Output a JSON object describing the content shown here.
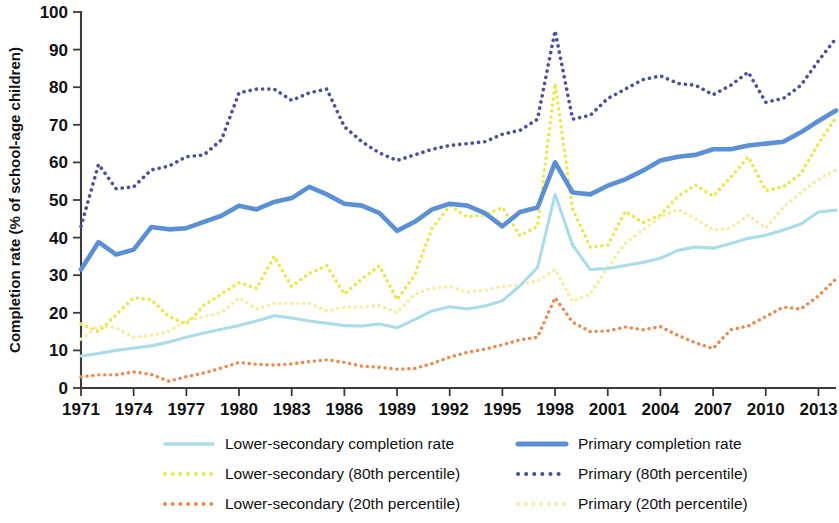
{
  "chart_data": {
    "type": "line",
    "title": "",
    "xlabel": "",
    "ylabel": "Completion rate (% of school-age children)",
    "xlim": [
      1971,
      2014
    ],
    "ylim": [
      0,
      100
    ],
    "grid": false,
    "legend_position": "bottom",
    "y_ticks": [
      0,
      10,
      20,
      30,
      40,
      50,
      60,
      70,
      80,
      90,
      100
    ],
    "y_tick_labels": [
      "0",
      "10",
      "20",
      "30",
      "40",
      "50",
      "60",
      "70",
      "80",
      "90",
      "100"
    ],
    "x_ticks": [
      1971,
      1974,
      1977,
      1980,
      1983,
      1986,
      1989,
      1992,
      1995,
      1998,
      2001,
      2004,
      2007,
      2010,
      2013
    ],
    "x_tick_labels": [
      "1971",
      "1974",
      "1977",
      "1980",
      "1983",
      "1986",
      "1989",
      "1992",
      "1995",
      "1998",
      "2001",
      "2004",
      "2007",
      "2010",
      "2013"
    ],
    "x": [
      1971,
      1972,
      1973,
      1974,
      1975,
      1976,
      1977,
      1978,
      1979,
      1980,
      1981,
      1982,
      1983,
      1984,
      1985,
      1986,
      1987,
      1988,
      1989,
      1990,
      1991,
      1992,
      1993,
      1994,
      1995,
      1996,
      1997,
      1998,
      1999,
      2000,
      2001,
      2002,
      2003,
      2004,
      2005,
      2006,
      2007,
      2008,
      2009,
      2010,
      2011,
      2012,
      2013,
      2014
    ],
    "series": [
      {
        "name": "Lower-secondary completion rate",
        "key": "ls_rate",
        "color": "#aadcea",
        "style": "solid",
        "width": 3.1,
        "values": [
          8.5,
          9.2,
          10.0,
          10.6,
          11.2,
          12.2,
          13.5,
          14.6,
          15.6,
          16.6,
          17.8,
          19.2,
          18.6,
          17.8,
          17.2,
          16.6,
          16.5,
          17.0,
          16.0,
          18.2,
          20.5,
          21.6,
          21.0,
          21.8,
          23.2,
          27.2,
          32.0,
          51.5,
          38.0,
          31.5,
          31.8,
          32.6,
          33.4,
          34.5,
          36.6,
          37.5,
          37.2,
          38.4,
          39.8,
          40.6,
          42.0,
          43.6,
          46.8,
          47.3
        ]
      },
      {
        "name": "Lower-secondary (80th percentile)",
        "key": "ls_p80",
        "color": "#e8e84a",
        "style": "dotted",
        "width": 3.4,
        "values": [
          17.0,
          15.0,
          19.5,
          24.0,
          23.5,
          19.0,
          17.0,
          22.0,
          25.0,
          28.0,
          26.5,
          35.0,
          27.0,
          30.5,
          32.5,
          25.0,
          29.0,
          32.5,
          23.5,
          30.0,
          42.5,
          48.5,
          45.5,
          46.0,
          48.0,
          40.5,
          43.0,
          81.0,
          47.5,
          37.5,
          38.0,
          47.0,
          44.0,
          46.0,
          51.0,
          54.0,
          51.0,
          56.0,
          61.5,
          52.5,
          53.5,
          57.0,
          65.0,
          72.0
        ]
      },
      {
        "name": "Lower-secondary (20th percentile)",
        "key": "ls_p20",
        "color": "#ec8a4d",
        "style": "dotted",
        "width": 3.4,
        "values": [
          3.0,
          3.5,
          3.5,
          4.3,
          3.6,
          1.8,
          3.0,
          4.0,
          5.3,
          6.8,
          6.3,
          6.1,
          6.4,
          7.0,
          7.5,
          6.8,
          5.8,
          5.5,
          5.0,
          5.2,
          6.5,
          8.2,
          9.5,
          10.3,
          11.5,
          12.8,
          13.5,
          24.0,
          17.5,
          15.0,
          15.2,
          16.2,
          15.5,
          16.3,
          14.0,
          12.0,
          10.5,
          15.5,
          16.5,
          19.0,
          21.5,
          21.0,
          24.5,
          29.0
        ]
      },
      {
        "name": "Primary completion rate",
        "key": "pri_rate",
        "color": "#5b8fd6",
        "style": "solid",
        "width": 4.6,
        "values": [
          31.5,
          38.8,
          35.5,
          36.8,
          42.8,
          42.2,
          42.5,
          44.2,
          45.8,
          48.5,
          47.5,
          49.5,
          50.5,
          53.5,
          51.5,
          49.0,
          48.5,
          46.5,
          41.8,
          44.2,
          47.5,
          49.0,
          48.5,
          46.5,
          43.0,
          46.8,
          48.0,
          60.0,
          52.0,
          51.5,
          53.8,
          55.5,
          57.8,
          60.5,
          61.5,
          62.0,
          63.5,
          63.5,
          64.5,
          65.0,
          65.5,
          68.0,
          71.0,
          73.8
        ]
      },
      {
        "name": "Primary (80th percentile)",
        "key": "pri_p80",
        "color": "#4d4f9e",
        "style": "dotted",
        "width": 3.6,
        "values": [
          43.0,
          59.5,
          53.0,
          53.5,
          58.0,
          59.0,
          61.5,
          62.0,
          66.0,
          78.5,
          79.5,
          79.5,
          76.5,
          78.5,
          79.5,
          69.5,
          65.5,
          62.5,
          60.5,
          62.0,
          63.5,
          64.5,
          65.0,
          65.5,
          67.5,
          68.5,
          71.5,
          95.0,
          71.5,
          72.5,
          77.0,
          79.5,
          82.0,
          83.0,
          81.0,
          80.5,
          78.0,
          80.5,
          84.0,
          76.0,
          77.0,
          80.5,
          87.0,
          93.0
        ]
      },
      {
        "name": "Primary (20th percentile)",
        "key": "pri_p20",
        "color": "#f5eda0",
        "style": "dotted",
        "width": 3.4,
        "values": [
          13.0,
          16.5,
          16.0,
          13.5,
          14.0,
          15.0,
          18.0,
          19.0,
          20.0,
          24.0,
          21.0,
          22.5,
          22.5,
          22.5,
          20.5,
          21.5,
          21.5,
          22.0,
          20.0,
          25.0,
          26.5,
          27.0,
          25.5,
          26.0,
          27.0,
          27.5,
          28.5,
          31.5,
          23.0,
          25.0,
          32.0,
          38.5,
          42.0,
          45.5,
          47.5,
          45.0,
          42.0,
          42.5,
          46.0,
          42.5,
          48.0,
          52.0,
          55.5,
          58.0
        ]
      }
    ]
  },
  "legend": {
    "items": [
      {
        "label": "Lower-secondary completion rate",
        "key": "ls_rate"
      },
      {
        "label": "Primary completion rate",
        "key": "pri_rate"
      },
      {
        "label": "Lower-secondary (80th percentile)",
        "key": "ls_p80"
      },
      {
        "label": "Primary (80th percentile)",
        "key": "pri_p80"
      },
      {
        "label": "Lower-secondary (20th percentile)",
        "key": "ls_p20"
      },
      {
        "label": "Primary (20th percentile)",
        "key": "pri_p20"
      }
    ]
  }
}
